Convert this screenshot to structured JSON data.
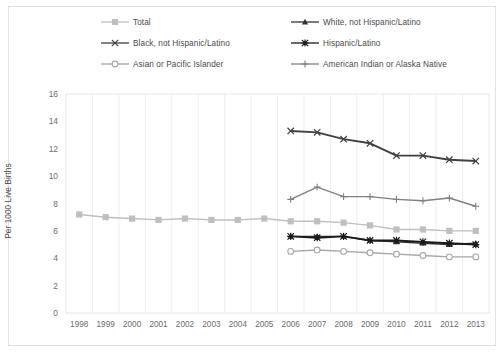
{
  "chart_data": {
    "type": "line",
    "title": "",
    "xlabel": "",
    "ylabel": "Per 1000 Live Births",
    "ylim": [
      0,
      16
    ],
    "yticks": [
      0,
      2,
      4,
      6,
      8,
      10,
      12,
      14,
      16
    ],
    "grid": "vertical",
    "legend_position": "top",
    "categories": [
      "1998",
      "1999",
      "2000",
      "2001",
      "2002",
      "2003",
      "2004",
      "2005",
      "2006",
      "2007",
      "2008",
      "2009",
      "2010",
      "2011",
      "2012",
      "2013"
    ],
    "series": [
      {
        "name": "Total",
        "color": "#bfbfbf",
        "marker": "square",
        "values": [
          7.2,
          7.0,
          6.9,
          6.8,
          6.9,
          6.8,
          6.8,
          6.9,
          6.7,
          6.7,
          6.6,
          6.4,
          6.1,
          6.1,
          6.0,
          6.0
        ]
      },
      {
        "name": "White, not Hispanic/Latino",
        "color": "#333333",
        "marker": "triangle",
        "values": [
          null,
          null,
          null,
          null,
          null,
          null,
          null,
          null,
          5.6,
          5.6,
          5.6,
          5.3,
          5.2,
          5.1,
          5.0,
          5.1
        ]
      },
      {
        "name": "Black, not Hispanic/Latino",
        "color": "#404040",
        "marker": "x",
        "values": [
          null,
          null,
          null,
          null,
          null,
          null,
          null,
          null,
          13.3,
          13.2,
          12.7,
          12.4,
          11.5,
          11.5,
          11.2,
          11.1
        ]
      },
      {
        "name": "Hispanic/Latino",
        "color": "#1a1a1a",
        "marker": "asterisk",
        "values": [
          null,
          null,
          null,
          null,
          null,
          null,
          null,
          null,
          5.6,
          5.5,
          5.6,
          5.3,
          5.3,
          5.2,
          5.1,
          5.0
        ]
      },
      {
        "name": "Asian or Pacific Islander",
        "color": "#a6a6a6",
        "marker": "circle",
        "values": [
          null,
          null,
          null,
          null,
          null,
          null,
          null,
          null,
          4.5,
          4.6,
          4.5,
          4.4,
          4.3,
          4.2,
          4.1,
          4.1
        ]
      },
      {
        "name": "American Indian or Alaska Native",
        "color": "#808080",
        "marker": "plus",
        "values": [
          null,
          null,
          null,
          null,
          null,
          null,
          null,
          null,
          8.3,
          9.2,
          8.5,
          8.5,
          8.3,
          8.2,
          8.4,
          7.8
        ]
      }
    ]
  },
  "legend": {
    "items": [
      {
        "label": "Total",
        "marker": "square",
        "color": "#bfbfbf"
      },
      {
        "label": "White, not Hispanic/Latino",
        "marker": "triangle",
        "color": "#333333"
      },
      {
        "label": "Black, not Hispanic/Latino",
        "marker": "x",
        "color": "#404040"
      },
      {
        "label": "Hispanic/Latino",
        "marker": "asterisk",
        "color": "#1a1a1a"
      },
      {
        "label": "Asian or Pacific Islander",
        "marker": "circle",
        "color": "#a6a6a6"
      },
      {
        "label": "American Indian or Alaska Native",
        "marker": "plus",
        "color": "#808080"
      }
    ]
  },
  "axis": {
    "y_title": "Per 1000 Live Births"
  }
}
